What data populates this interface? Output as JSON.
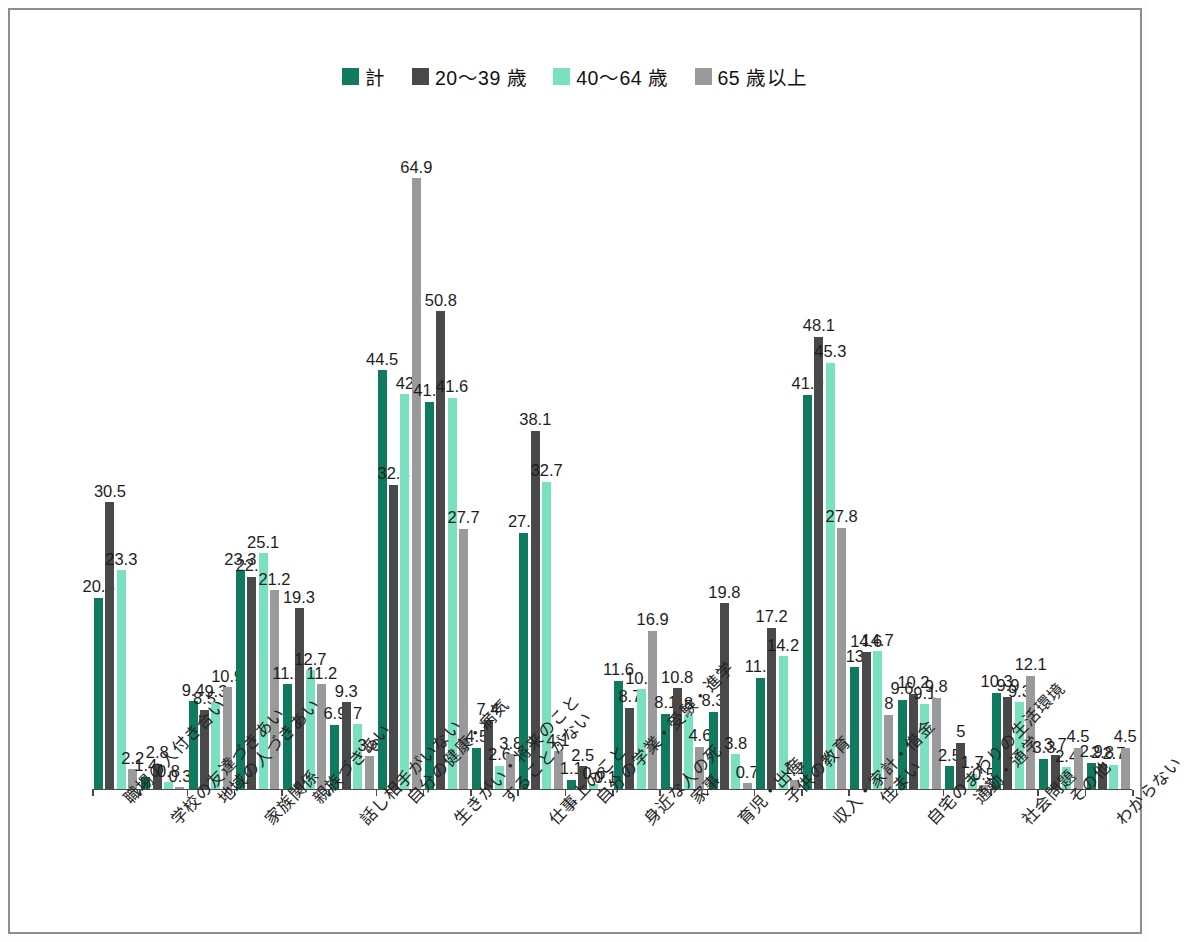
{
  "chart_data": {
    "type": "bar",
    "title": "",
    "subtitle": "",
    "xlabel": "",
    "ylabel": "",
    "ylim": [
      0,
      70
    ],
    "grid": false,
    "legend_position": "top-center",
    "value_labels": true,
    "categories": [
      "職場の人付き合い",
      "学校の友達づきあい",
      "地域の人づきあい",
      "家族関係",
      "親族づきあい",
      "話し相手がいない",
      "自分の健康・病気",
      "生きがい・将来のこと",
      "することがない",
      "仕事上のこと",
      "自分の学業・受験・進学",
      "身近な人の死",
      "家事",
      "育児・出産",
      "子供の教育",
      "収入・家計・借金",
      "住まい",
      "自宅のまわりの生活環境",
      "通勤・通学",
      "社会問題",
      "その他",
      "わからない"
    ],
    "series": [
      {
        "name": "計",
        "color": "#0f7a5e",
        "values": [
          20.4,
          1.4,
          9.4,
          23.3,
          11.2,
          6.9,
          44.5,
          41.2,
          4.5,
          27.3,
          1.1,
          11.6,
          8.1,
          8.3,
          11.9,
          41.9,
          13,
          9.6,
          2.5,
          10.3,
          3.3,
          2.9
        ]
      },
      {
        "name": "20〜39 歳",
        "color": "#494949",
        "values": [
          30.5,
          2.8,
          8.5,
          22.6,
          19.3,
          9.3,
          32.4,
          50.8,
          7.4,
          38.1,
          2.5,
          8.7,
          10.8,
          19.8,
          17.2,
          48.1,
          14.6,
          10.2,
          5,
          9.9,
          3.7,
          2.8
        ]
      },
      {
        "name": "40〜64 歳",
        "color": "#79e0c0",
        "values": [
          23.3,
          0.8,
          9.3,
          25.1,
          12.7,
          7,
          42,
          41.6,
          2.6,
          32.7,
          0.6,
          10.7,
          8,
          3.8,
          14.2,
          45.3,
          14.7,
          9.1,
          1.7,
          9.3,
          2.4,
          2.7
        ]
      },
      {
        "name": "65 歳以上",
        "color": "#9a9a9a",
        "values": [
          2.2,
          0.3,
          10.9,
          21.2,
          11.2,
          3.6,
          64.9,
          27.7,
          3.8,
          4.1,
          0.1,
          16.9,
          4.6,
          0.7,
          1.1,
          27.8,
          8,
          9.8,
          0.5,
          12.1,
          4.5,
          4.5
        ]
      }
    ]
  }
}
